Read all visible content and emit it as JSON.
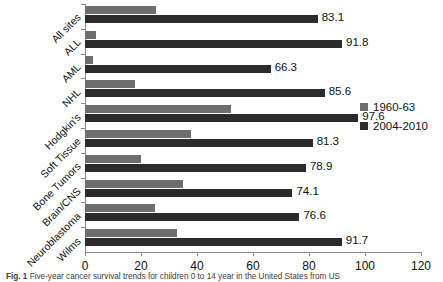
{
  "chart_data": {
    "type": "bar",
    "orientation": "horizontal",
    "title": "",
    "xlabel": "",
    "ylabel": "",
    "xlim": [
      0,
      120
    ],
    "xticks": [
      0,
      20,
      40,
      60,
      80,
      100,
      120
    ],
    "grid": false,
    "legend_position": "right",
    "categories": [
      "All sites",
      "ALL",
      "AML",
      "NHL",
      "Hodgkin's",
      "Soft Tissue",
      "Bone Tumors",
      "Brain/CNS",
      "Neuroblastoma",
      "Wilms"
    ],
    "series": [
      {
        "name": "1960-63",
        "color": "#6e6e6e",
        "values": [
          25.4,
          4.0,
          3.0,
          18.0,
          52.0,
          38.0,
          20.0,
          35.0,
          25.0,
          33.0
        ],
        "labels_shown": false
      },
      {
        "name": "2004-2010",
        "color": "#2b2b2b",
        "values": [
          83.1,
          91.8,
          66.3,
          85.6,
          97.6,
          81.3,
          78.9,
          74.1,
          76.6,
          91.7
        ],
        "labels_shown": true,
        "value_labels": [
          "83.1",
          "91.8",
          "66.3",
          "85.6",
          "97.6",
          "81.3",
          "78.9",
          "74.1",
          "76.6",
          "91.7"
        ]
      }
    ]
  },
  "legend": {
    "entries": [
      {
        "label": "1960-63",
        "color": "#6e6e6e"
      },
      {
        "label": "2004-2010",
        "color": "#2b2b2b"
      }
    ]
  },
  "caption": {
    "figure_number": "Fig. 1",
    "text": "Five-year cancer survival trends for children 0 to 14 year in the United States from US"
  }
}
